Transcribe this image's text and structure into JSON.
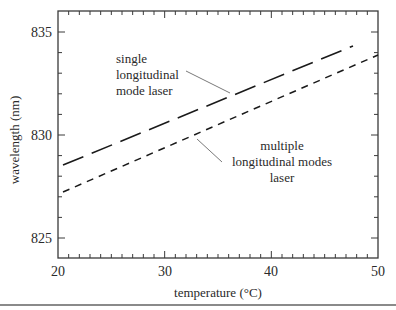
{
  "chart_data": {
    "type": "line",
    "title": "",
    "xlabel": "temperature (°C)",
    "ylabel": "wavelength (nm)",
    "xlim": [
      20,
      50
    ],
    "ylim": [
      823.8,
      836.0
    ],
    "x_ticks": [
      20,
      30,
      40,
      50
    ],
    "x_tick_labels": [
      "20",
      "30",
      "40",
      "50"
    ],
    "y_ticks": [
      825,
      830,
      835
    ],
    "y_tick_labels": [
      "825",
      "830",
      "835"
    ],
    "grid": false,
    "legend": "none (inline annotations with leader lines)",
    "series": [
      {
        "name": "single longitudinal mode laser",
        "style": "long-dash",
        "x": [
          20.5,
          47.7
        ],
        "y": [
          828.5,
          834.3
        ]
      },
      {
        "name": "multiple longitudinal modes laser",
        "style": "short-dash",
        "x": [
          20.5,
          50.0
        ],
        "y": [
          827.2,
          833.8
        ]
      }
    ],
    "annotations": [
      {
        "id": "single",
        "lines": [
          "single",
          "longitudinal",
          "mode laser"
        ]
      },
      {
        "id": "multi",
        "lines": [
          "multiple",
          "longitudinal modes",
          "laser"
        ]
      }
    ]
  },
  "colors": {
    "axis": "#3a3a3a",
    "series": "#1a1a1a",
    "leader": "#6a6a6a",
    "rule": "#8a8a8a"
  }
}
